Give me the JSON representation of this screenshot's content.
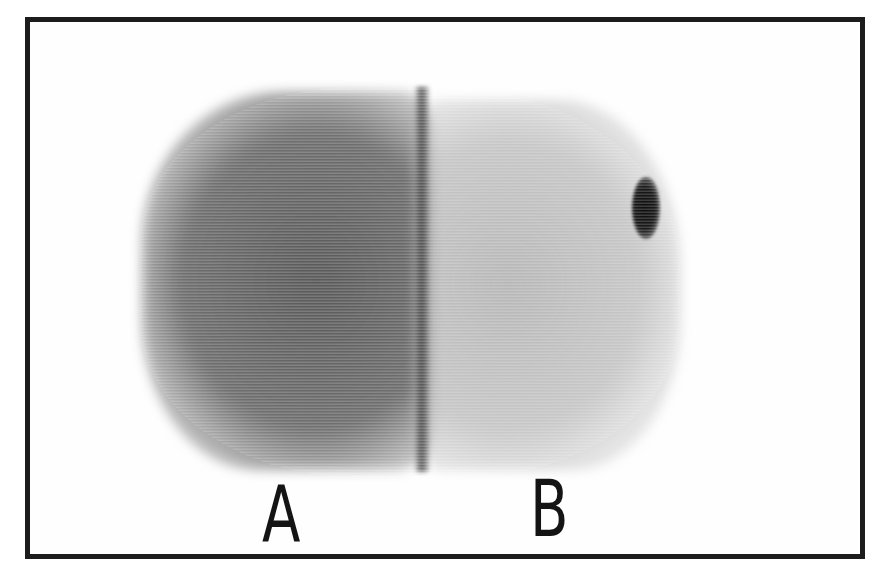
{
  "figure": {
    "labels": {
      "a": "A",
      "b": "B"
    },
    "regions": [
      {
        "id": "A",
        "tone": "dark gray",
        "color": "#5f5f5f"
      },
      {
        "id": "B",
        "tone": "light gray",
        "color": "#b4b4b4"
      }
    ],
    "features": {
      "divider_color": "#3c3c3c",
      "spot_color": "#0e0e0e",
      "frame_color": "#1c1c1c"
    }
  }
}
